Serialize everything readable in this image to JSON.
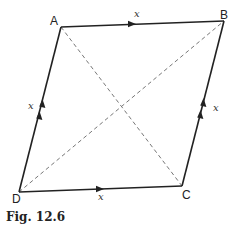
{
  "figure": {
    "caption": "Fig. 12.6",
    "vertices": {
      "A": {
        "label": "A",
        "x": 61,
        "y": 27
      },
      "B": {
        "label": "B",
        "x": 224,
        "y": 21
      },
      "C": {
        "label": "C",
        "x": 182,
        "y": 186
      },
      "D": {
        "label": "D",
        "x": 19,
        "y": 192
      }
    },
    "edges": [
      {
        "from": "A",
        "to": "B",
        "label": "x",
        "arrows": 1
      },
      {
        "from": "D",
        "to": "C",
        "label": "x",
        "arrows": 1
      },
      {
        "from": "D",
        "to": "A",
        "label": "x",
        "arrows": 2
      },
      {
        "from": "C",
        "to": "B",
        "label": "x",
        "arrows": 2
      }
    ],
    "diagonals": [
      {
        "from": "A",
        "to": "C",
        "style": "dashed"
      },
      {
        "from": "D",
        "to": "B",
        "style": "dashed"
      }
    ],
    "colors": {
      "line": "#222222",
      "dashed": "#777777"
    }
  }
}
